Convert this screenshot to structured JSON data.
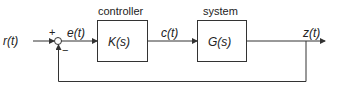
{
  "diagram": {
    "type": "feedback-control-loop",
    "input": {
      "label": "r(t)"
    },
    "summing_junction": {
      "plus": "+",
      "minus": "−"
    },
    "error_signal": {
      "label": "e(t)"
    },
    "controller": {
      "caption": "controller",
      "transfer": "K(s)"
    },
    "control_signal": {
      "label": "c(t)"
    },
    "system": {
      "caption": "system",
      "transfer": "G(s)"
    },
    "output": {
      "label": "z(t)"
    },
    "colors": {
      "line": "#333333",
      "background": "#ffffff"
    }
  }
}
